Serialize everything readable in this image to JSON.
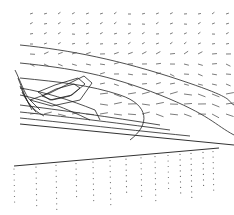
{
  "figure": {
    "upper_panel": {
      "contours": [
        "M20 45 C70 50, 120 60, 180 80 S 225 100, 234 105",
        "M20 63 C70 68, 110 75, 160 95 S 215 125, 234 135",
        "M20 78 C60 82, 90 85, 120 95 S 150 125, 130 140",
        "M20 88 C45 92, 70 100, 95 110 L 100 120",
        "M20 95 C45 100, 65 108, 90 120",
        "M38 92 L55 85 L78 78 L85 84 L72 95 L50 100 Z",
        "M42 96 L56 89 L74 84 L80 88 L70 96 L52 100 Z",
        "M30 100 L50 93 L84 76 L92 83 L80 100 L52 106 Z",
        "M15 70 C20 80, 25 95, 30 100 L 40 110",
        "M18 78 C22 88, 26 100, 32 110",
        "M20 86 C24 95, 28 104, 36 112",
        "M22 92 C26 100, 32 110, 44 116",
        "M20 105 C60 110, 110 117, 160 125",
        "M20 112 C60 116, 110 122, 170 130",
        "M20 118 C60 122, 110 128, 190 136"
      ],
      "walls": [
        "M20 124 L234 145"
      ],
      "vector_count": 160
    },
    "lower_panel": {
      "walls": [
        "M14 166 L219 148"
      ],
      "dot_columns": [
        14,
        36,
        56,
        76,
        93,
        110,
        126,
        141,
        155,
        168,
        180,
        191,
        203,
        213
      ]
    }
  }
}
